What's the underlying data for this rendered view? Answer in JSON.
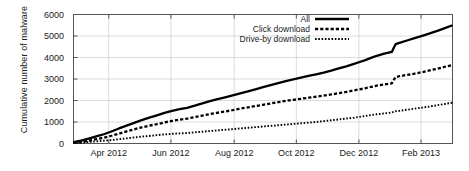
{
  "chart_data": {
    "type": "line",
    "title": "",
    "xlabel": "",
    "ylabel": "Cumulative number of malware",
    "ylim": [
      0,
      6000
    ],
    "yticks": [
      0,
      1000,
      2000,
      3000,
      4000,
      5000,
      6000
    ],
    "ytick_labels": [
      "0",
      "1000",
      "2000",
      "3000",
      "4000",
      "5000",
      "6000"
    ],
    "xlim": [
      "2012-03-01",
      "2013-03-10"
    ],
    "xtick_labels": [
      "Apr 2012",
      "Jun 2012",
      "Aug 2012",
      "Oct 2012",
      "Dec 2012",
      "Feb 2013"
    ],
    "xticks_frac": [
      0.093,
      0.257,
      0.424,
      0.588,
      0.753,
      0.917
    ],
    "grid": true,
    "legend_position": "top-right",
    "x": [
      0.0,
      0.02,
      0.04,
      0.06,
      0.08,
      0.1,
      0.12,
      0.14,
      0.16,
      0.18,
      0.2,
      0.22,
      0.24,
      0.26,
      0.28,
      0.3,
      0.32,
      0.34,
      0.36,
      0.38,
      0.4,
      0.42,
      0.44,
      0.46,
      0.48,
      0.5,
      0.52,
      0.54,
      0.56,
      0.58,
      0.6,
      0.62,
      0.64,
      0.66,
      0.68,
      0.7,
      0.72,
      0.74,
      0.755,
      0.77,
      0.785,
      0.8,
      0.82,
      0.84,
      0.845,
      0.85,
      0.86,
      0.88,
      0.9,
      0.92,
      0.94,
      0.96,
      0.98,
      1.0
    ],
    "series": [
      {
        "name": "All",
        "style": "solid",
        "values": [
          60,
          130,
          230,
          330,
          430,
          560,
          700,
          830,
          960,
          1090,
          1200,
          1310,
          1420,
          1520,
          1600,
          1660,
          1760,
          1870,
          1970,
          2060,
          2150,
          2240,
          2330,
          2420,
          2520,
          2620,
          2720,
          2810,
          2900,
          2980,
          3060,
          3140,
          3220,
          3300,
          3390,
          3490,
          3590,
          3700,
          3790,
          3880,
          3980,
          4080,
          4180,
          4260,
          4450,
          4620,
          4680,
          4790,
          4900,
          5010,
          5120,
          5240,
          5370,
          5500
        ]
      },
      {
        "name": "Click download",
        "style": "dashed",
        "values": [
          30,
          70,
          130,
          200,
          270,
          360,
          460,
          560,
          660,
          750,
          830,
          900,
          980,
          1050,
          1110,
          1160,
          1230,
          1300,
          1370,
          1430,
          1490,
          1550,
          1620,
          1680,
          1740,
          1800,
          1860,
          1920,
          1980,
          2030,
          2080,
          2130,
          2180,
          2230,
          2280,
          2340,
          2400,
          2470,
          2520,
          2570,
          2630,
          2690,
          2750,
          2800,
          2960,
          3090,
          3130,
          3190,
          3250,
          3320,
          3400,
          3480,
          3570,
          3650
        ]
      },
      {
        "name": "Drive-by download",
        "style": "dotted",
        "values": [
          20,
          40,
          70,
          100,
          130,
          160,
          200,
          240,
          280,
          320,
          350,
          390,
          420,
          450,
          470,
          490,
          520,
          550,
          580,
          610,
          640,
          670,
          700,
          730,
          760,
          790,
          820,
          850,
          880,
          910,
          940,
          970,
          1000,
          1040,
          1080,
          1120,
          1160,
          1200,
          1240,
          1280,
          1320,
          1360,
          1400,
          1440,
          1470,
          1500,
          1520,
          1570,
          1620,
          1670,
          1720,
          1780,
          1840,
          1900
        ]
      }
    ]
  },
  "legend": {
    "items": [
      {
        "label": "All",
        "style": "solid"
      },
      {
        "label": "Click download",
        "style": "dashed"
      },
      {
        "label": "Drive-by download",
        "style": "dotted"
      }
    ]
  },
  "colors": {
    "line": "#000000",
    "axis": "#555555",
    "grid": "#cccccc",
    "background": "#ffffff"
  }
}
